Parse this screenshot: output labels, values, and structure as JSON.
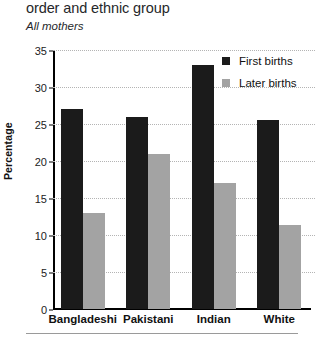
{
  "title": "order and ethnic group",
  "subtitle": "All mothers",
  "y_axis_title": "Percentage",
  "legend": {
    "items": [
      {
        "label": "First births",
        "color": "#1b1b1b",
        "swatch": "legend-swatch-first-births"
      },
      {
        "label": "Later births",
        "color": "#a3a3a3",
        "swatch": "legend-swatch-later-births"
      }
    ]
  },
  "y_ticks": [
    "0",
    "5",
    "10",
    "15",
    "20",
    "25",
    "30",
    "35"
  ],
  "x_categories": [
    "Bangladeshi",
    "Pakistani",
    "Indian",
    "White"
  ],
  "chart_data": {
    "type": "bar",
    "title": "order and ethnic group",
    "subtitle": "All mothers",
    "xlabel": "",
    "ylabel": "Percentage",
    "ylim": [
      0,
      35
    ],
    "yticks": [
      0,
      5,
      10,
      15,
      20,
      25,
      30,
      35
    ],
    "grid": true,
    "legend_position": "top-right",
    "categories": [
      "Bangladeshi",
      "Pakistani",
      "Indian",
      "White"
    ],
    "series": [
      {
        "name": "First births",
        "color": "#1b1b1b",
        "values": [
          27,
          26,
          33,
          25.5
        ]
      },
      {
        "name": "Later births",
        "color": "#a3a3a3",
        "values": [
          13,
          21,
          17,
          11.3
        ]
      }
    ]
  }
}
